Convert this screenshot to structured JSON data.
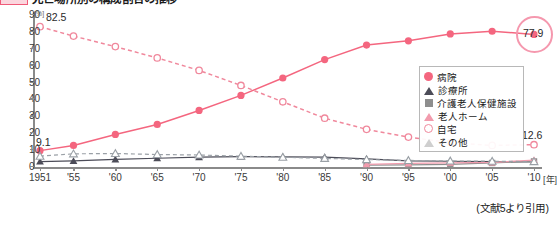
{
  "title": {
    "badge": "legend-color-swatch",
    "text": "死亡場所別の構成割合の推移"
  },
  "chart_data": {
    "type": "line",
    "title": "死亡場所別の構成割合の推移",
    "xlabel": "年",
    "ylabel": "",
    "yunit": "[%]",
    "xunit": "[年]",
    "ylim": [
      0,
      90
    ],
    "yticks": [
      0,
      10,
      20,
      30,
      40,
      50,
      60,
      70,
      80,
      90
    ],
    "grid": false,
    "legend_position": "right-center",
    "x": [
      1951,
      1955,
      1960,
      1965,
      1970,
      1975,
      1980,
      1985,
      1990,
      1995,
      2000,
      2005,
      2010
    ],
    "tick_labels": [
      "1951",
      "'55",
      "'60",
      "'65",
      "'70",
      "'75",
      "'80",
      "'85",
      "'90",
      "'95",
      "'00",
      "'05",
      "'10"
    ],
    "series": [
      {
        "name": "病院",
        "marker": "circle-filled",
        "color": "#f4667f",
        "line": "solid",
        "values": [
          9.1,
          12.2,
          18.7,
          24.6,
          32.9,
          41.8,
          52.1,
          63.0,
          71.6,
          74.1,
          78.2,
          79.8,
          77.9
        ]
      },
      {
        "name": "診療所",
        "marker": "triangle-dark",
        "color": "#4c4c58",
        "line": "solid",
        "values": [
          2.6,
          3.0,
          3.9,
          4.6,
          5.2,
          5.5,
          5.4,
          5.3,
          4.2,
          3.0,
          2.8,
          2.6,
          2.4
        ]
      },
      {
        "name": "介護老人保健施設",
        "marker": "square-grey",
        "color": "#8e8e8e",
        "line": "solid",
        "values": [
          null,
          null,
          null,
          null,
          null,
          null,
          null,
          null,
          0.5,
          0.7,
          1.0,
          1.8,
          2.7
        ]
      },
      {
        "name": "老人ホーム",
        "marker": "triangle-pink",
        "color": "#f29bad",
        "line": "solid",
        "values": [
          null,
          null,
          null,
          null,
          null,
          null,
          null,
          null,
          1.0,
          1.5,
          1.9,
          2.1,
          3.5
        ]
      },
      {
        "name": "自宅",
        "marker": "circle-open",
        "color": "#f0889c",
        "line": "dashed",
        "values": [
          82.5,
          76.9,
          70.7,
          64.0,
          56.6,
          47.7,
          38.0,
          28.3,
          21.7,
          17.1,
          13.9,
          12.2,
          12.6
        ]
      },
      {
        "name": "その他",
        "marker": "triangle-open",
        "color": "#9aa0a6",
        "line": "dashed",
        "values": [
          5.8,
          7.2,
          7.4,
          6.8,
          6.5,
          5.8,
          5.2,
          4.5,
          3.8,
          3.3,
          3.0,
          2.8,
          2.6
        ]
      }
    ],
    "annotations": [
      {
        "text": "82.5",
        "series": "自宅",
        "x": 1951
      },
      {
        "text": "9.1",
        "series": "病院",
        "x": 1951
      },
      {
        "text": "77.9",
        "series": "病院",
        "x": 2010,
        "highlighted": true
      },
      {
        "text": "12.6",
        "series": "自宅",
        "x": 2010
      }
    ],
    "source_note": "(文献5より引用)"
  },
  "legend": {
    "items": [
      {
        "label": "病院",
        "marker": "circle-filled"
      },
      {
        "label": "診療所",
        "marker": "triangle-dark"
      },
      {
        "label": "介護老人保健施設",
        "marker": "square-grey"
      },
      {
        "label": "老人ホーム",
        "marker": "triangle-pink"
      },
      {
        "label": "自宅",
        "marker": "circle-open"
      },
      {
        "label": "その他",
        "marker": "triangle-open"
      }
    ]
  }
}
